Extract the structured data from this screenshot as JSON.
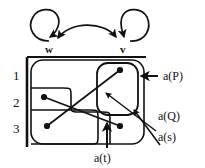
{
  "figure": {
    "stroke_color": "#111111",
    "background": "#ffffff"
  },
  "top_graph": {
    "nodes": [
      {
        "id": "w",
        "label": "w",
        "x": 49,
        "y": 46
      },
      {
        "id": "v",
        "label": "v",
        "x": 123,
        "y": 46
      }
    ],
    "edges": [
      {
        "from": "w",
        "to": "w",
        "type": "self-loop"
      },
      {
        "from": "v",
        "to": "v",
        "type": "self-loop"
      },
      {
        "from": "w",
        "to": "v",
        "type": "arc-bidirectional"
      }
    ]
  },
  "rows": {
    "labels": [
      "1",
      "2",
      "3"
    ],
    "positions_y": [
      76,
      103,
      129
    ]
  },
  "annotations": [
    {
      "id": "aP",
      "label": "a(P)",
      "x": 163,
      "y": 76,
      "target": "outer-region"
    },
    {
      "id": "aQ",
      "label": "a(Q)",
      "x": 152,
      "y": 115,
      "target": "inner-region"
    },
    {
      "id": "as",
      "label": "a(s)",
      "x": 152,
      "y": 136,
      "target": "inner-point"
    },
    {
      "id": "at",
      "label": "a(t)",
      "x": 99,
      "y": 158,
      "target": "bottom-point"
    }
  ],
  "points": [
    {
      "id": "p1",
      "x": 120,
      "y": 70
    },
    {
      "id": "p2",
      "x": 44,
      "y": 97
    },
    {
      "id": "p3",
      "x": 47,
      "y": 126
    },
    {
      "id": "p4",
      "x": 120,
      "y": 126
    }
  ]
}
